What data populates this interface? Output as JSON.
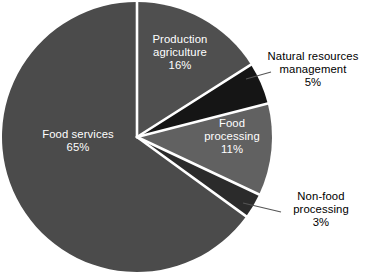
{
  "chart_data": {
    "type": "pie",
    "title": "",
    "subtitle": "",
    "xlabel": "",
    "ylabel": "",
    "legend_position": "none",
    "grid": false,
    "units": "percent",
    "total": 100,
    "start_angle_deg": 0,
    "direction": "clockwise",
    "categories": [
      "Production agriculture",
      "Natural resources management",
      "Food processing",
      "Non-food processing",
      "Food services"
    ],
    "values": [
      16,
      5,
      11,
      3,
      65
    ],
    "slices": [
      {
        "label": "Production agriculture",
        "label_line1": "Production",
        "label_line2": "agriculture",
        "value": 16,
        "value_text": "16%",
        "color": "#4f4f4f",
        "label_placement": "inside",
        "label_color": "#ffffff",
        "has_leader_line": false
      },
      {
        "label": "Natural resources management",
        "label_line1": "Natural resources",
        "label_line2": "management",
        "value": 5,
        "value_text": "5%",
        "color": "#151515",
        "label_placement": "outside",
        "label_color": "#000000",
        "has_leader_line": true
      },
      {
        "label": "Food processing",
        "label_line1": "Food",
        "label_line2": "processing",
        "value": 11,
        "value_text": "11%",
        "color": "#616161",
        "label_placement": "inside",
        "label_color": "#ffffff",
        "has_leader_line": false
      },
      {
        "label": "Non-food processing",
        "label_line1": "Non-food",
        "label_line2": "processing",
        "value": 3,
        "value_text": "3%",
        "color": "#2b2b2b",
        "label_placement": "outside",
        "label_color": "#000000",
        "has_leader_line": true
      },
      {
        "label": "Food services",
        "label_line1": "Food services",
        "label_line2": "",
        "value": 65,
        "value_text": "65%",
        "color": "#4b4b4b",
        "label_placement": "inside",
        "label_color": "#ffffff",
        "has_leader_line": false
      }
    ],
    "colors": {
      "background": "#ffffff",
      "slice_separator": "#ffffff",
      "leader_line": "#555555",
      "inside_label_text": "#ffffff",
      "outside_label_text": "#000000"
    }
  }
}
